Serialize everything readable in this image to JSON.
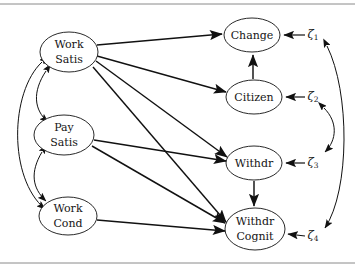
{
  "figure": {
    "type": "path-diagram",
    "title": "",
    "background_color": "#ffffff",
    "stroke_color": "#111111",
    "rule_color": "#8a8a8a"
  },
  "nodes": [
    {
      "id": "work_satis",
      "label_line1": "Work",
      "label_line2": "Satis",
      "cx": 69,
      "cy": 52,
      "rx": 29,
      "ry": 20
    },
    {
      "id": "pay_satis",
      "label_line1": "Pay",
      "label_line2": "Satis",
      "cx": 64,
      "cy": 135,
      "rx": 30,
      "ry": 20
    },
    {
      "id": "work_cond",
      "label_line1": "Work",
      "label_line2": "Cond",
      "cx": 68,
      "cy": 216,
      "rx": 29,
      "ry": 19
    },
    {
      "id": "change",
      "label_line1": "Change",
      "label_line2": "",
      "cx": 252,
      "cy": 35,
      "rx": 28,
      "ry": 17
    },
    {
      "id": "citizen",
      "label_line1": "Citizen",
      "label_line2": "",
      "cx": 254,
      "cy": 97,
      "rx": 28,
      "ry": 17
    },
    {
      "id": "withdr",
      "label_line1": "Withdr",
      "label_line2": "",
      "cx": 254,
      "cy": 163,
      "rx": 28,
      "ry": 17
    },
    {
      "id": "withdr_cognit",
      "label_line1": "Withdr",
      "label_line2": "Cognit",
      "cx": 255,
      "cy": 229,
      "rx": 30,
      "ry": 21
    }
  ],
  "disturbances": [
    {
      "id": "zeta1",
      "symbol": "ζ",
      "subscript": "1",
      "x": 315,
      "y": 35,
      "target": "change"
    },
    {
      "id": "zeta2",
      "symbol": "ζ",
      "subscript": "2",
      "x": 315,
      "y": 97,
      "target": "citizen"
    },
    {
      "id": "zeta3",
      "symbol": "ζ",
      "subscript": "3",
      "x": 315,
      "y": 163,
      "target": "withdr"
    },
    {
      "id": "zeta4",
      "symbol": "ζ",
      "subscript": "4",
      "x": 315,
      "y": 236,
      "target": "withdr_cognit"
    }
  ],
  "directed_paths": [
    {
      "from": "work_satis",
      "to": "change"
    },
    {
      "from": "work_satis",
      "to": "citizen"
    },
    {
      "from": "work_satis",
      "to": "withdr"
    },
    {
      "from": "work_satis",
      "to": "withdr_cognit"
    },
    {
      "from": "pay_satis",
      "to": "withdr"
    },
    {
      "from": "pay_satis",
      "to": "withdr_cognit"
    },
    {
      "from": "work_cond",
      "to": "withdr_cognit"
    },
    {
      "from": "citizen",
      "to": "change"
    },
    {
      "from": "withdr",
      "to": "withdr_cognit"
    }
  ],
  "covariance_arcs": [
    {
      "between": [
        "work_satis",
        "pay_satis"
      ],
      "side": "left",
      "span": "adjacent"
    },
    {
      "between": [
        "pay_satis",
        "work_cond"
      ],
      "side": "left",
      "span": "adjacent"
    },
    {
      "between": [
        "work_satis",
        "work_cond"
      ],
      "side": "left",
      "span": "outer"
    },
    {
      "between": [
        "zeta2",
        "zeta3"
      ],
      "side": "right",
      "span": "adjacent"
    },
    {
      "between": [
        "zeta1",
        "zeta4"
      ],
      "side": "right",
      "span": "outer"
    }
  ],
  "rules": [
    {
      "id": "top-rule",
      "y": 4,
      "x1": 0,
      "x2": 355
    },
    {
      "id": "bottom-rule",
      "y": 263,
      "x1": 0,
      "x2": 355
    }
  ]
}
